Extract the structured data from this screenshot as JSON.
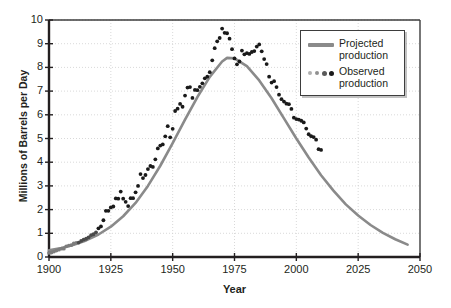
{
  "chart_data": {
    "type": "line",
    "title": "",
    "xlabel": "Year",
    "ylabel": "Millions of Barrels per Day",
    "xlim": [
      1900,
      2050
    ],
    "ylim": [
      0,
      10
    ],
    "xticks": [
      1900,
      1925,
      1950,
      1975,
      2000,
      2025,
      2050
    ],
    "yticks": [
      0,
      1,
      2,
      3,
      4,
      5,
      6,
      7,
      8,
      9,
      10
    ],
    "grid": true,
    "legend_position": "top-right",
    "colors": {
      "projected": "#8a8a8a",
      "observed": "#1a1a1a",
      "axis": "#231f20",
      "grid": "#cfcfcf",
      "background": "#ffffff"
    },
    "series": [
      {
        "name": "Projected production",
        "type": "line",
        "color": "#8a8a8a",
        "points": [
          [
            1900,
            0.28
          ],
          [
            1905,
            0.38
          ],
          [
            1910,
            0.52
          ],
          [
            1915,
            0.7
          ],
          [
            1920,
            0.95
          ],
          [
            1925,
            1.28
          ],
          [
            1930,
            1.72
          ],
          [
            1935,
            2.28
          ],
          [
            1940,
            3.0
          ],
          [
            1945,
            3.85
          ],
          [
            1950,
            4.8
          ],
          [
            1955,
            5.8
          ],
          [
            1960,
            6.75
          ],
          [
            1965,
            7.6
          ],
          [
            1970,
            8.25
          ],
          [
            1972,
            8.4
          ],
          [
            1975,
            8.38
          ],
          [
            1980,
            8.05
          ],
          [
            1985,
            7.45
          ],
          [
            1990,
            6.7
          ],
          [
            1995,
            5.85
          ],
          [
            2000,
            5.0
          ],
          [
            2005,
            4.2
          ],
          [
            2010,
            3.45
          ],
          [
            2015,
            2.8
          ],
          [
            2020,
            2.22
          ],
          [
            2025,
            1.75
          ],
          [
            2030,
            1.35
          ],
          [
            2035,
            1.02
          ],
          [
            2040,
            0.75
          ],
          [
            2045,
            0.52
          ]
        ]
      },
      {
        "name": "Observed production",
        "type": "scatter",
        "color": "#1a1a1a",
        "points": [
          [
            1900,
            0.17
          ],
          [
            1901,
            0.19
          ],
          [
            1902,
            0.23
          ],
          [
            1903,
            0.27
          ],
          [
            1904,
            0.31
          ],
          [
            1905,
            0.35
          ],
          [
            1906,
            0.35
          ],
          [
            1907,
            0.45
          ],
          [
            1908,
            0.48
          ],
          [
            1909,
            0.5
          ],
          [
            1910,
            0.57
          ],
          [
            1911,
            0.6
          ],
          [
            1912,
            0.61
          ],
          [
            1913,
            0.68
          ],
          [
            1914,
            0.73
          ],
          [
            1915,
            0.77
          ],
          [
            1916,
            0.83
          ],
          [
            1917,
            0.92
          ],
          [
            1918,
            0.96
          ],
          [
            1919,
            1.04
          ],
          [
            1920,
            1.21
          ],
          [
            1921,
            1.29
          ],
          [
            1922,
            1.55
          ],
          [
            1923,
            1.95
          ],
          [
            1924,
            1.95
          ],
          [
            1925,
            2.09
          ],
          [
            1926,
            2.13
          ],
          [
            1927,
            2.47
          ],
          [
            1928,
            2.46
          ],
          [
            1929,
            2.76
          ],
          [
            1930,
            2.46
          ],
          [
            1931,
            2.33
          ],
          [
            1932,
            2.15
          ],
          [
            1933,
            2.48
          ],
          [
            1934,
            2.48
          ],
          [
            1935,
            2.73
          ],
          [
            1936,
            3.0
          ],
          [
            1937,
            3.5
          ],
          [
            1938,
            3.33
          ],
          [
            1939,
            3.46
          ],
          [
            1940,
            3.71
          ],
          [
            1941,
            3.84
          ],
          [
            1942,
            3.8
          ],
          [
            1943,
            4.12
          ],
          [
            1944,
            4.58
          ],
          [
            1945,
            4.7
          ],
          [
            1946,
            4.75
          ],
          [
            1947,
            5.09
          ],
          [
            1948,
            5.52
          ],
          [
            1949,
            5.05
          ],
          [
            1950,
            5.41
          ],
          [
            1951,
            6.16
          ],
          [
            1952,
            6.26
          ],
          [
            1953,
            6.46
          ],
          [
            1954,
            6.34
          ],
          [
            1955,
            6.81
          ],
          [
            1956,
            7.15
          ],
          [
            1957,
            7.17
          ],
          [
            1958,
            6.71
          ],
          [
            1959,
            7.05
          ],
          [
            1960,
            7.04
          ],
          [
            1961,
            7.18
          ],
          [
            1962,
            7.33
          ],
          [
            1963,
            7.54
          ],
          [
            1964,
            7.61
          ],
          [
            1965,
            7.8
          ],
          [
            1966,
            8.3
          ],
          [
            1967,
            8.81
          ],
          [
            1968,
            9.1
          ],
          [
            1969,
            9.24
          ],
          [
            1970,
            9.64
          ],
          [
            1971,
            9.46
          ],
          [
            1972,
            9.44
          ],
          [
            1973,
            9.21
          ],
          [
            1974,
            8.77
          ],
          [
            1975,
            8.38
          ],
          [
            1976,
            8.13
          ],
          [
            1977,
            8.25
          ],
          [
            1978,
            8.71
          ],
          [
            1979,
            8.55
          ],
          [
            1980,
            8.6
          ],
          [
            1981,
            8.57
          ],
          [
            1982,
            8.65
          ],
          [
            1983,
            8.69
          ],
          [
            1984,
            8.88
          ],
          [
            1985,
            8.97
          ],
          [
            1986,
            8.68
          ],
          [
            1987,
            8.35
          ],
          [
            1988,
            8.14
          ],
          [
            1989,
            7.61
          ],
          [
            1990,
            7.36
          ],
          [
            1991,
            7.42
          ],
          [
            1992,
            7.17
          ],
          [
            1993,
            6.85
          ],
          [
            1994,
            6.66
          ],
          [
            1995,
            6.56
          ],
          [
            1996,
            6.47
          ],
          [
            1997,
            6.45
          ],
          [
            1998,
            6.25
          ],
          [
            1999,
            5.88
          ],
          [
            2000,
            5.82
          ],
          [
            2001,
            5.8
          ],
          [
            2002,
            5.75
          ],
          [
            2003,
            5.68
          ],
          [
            2004,
            5.42
          ],
          [
            2005,
            5.18
          ],
          [
            2006,
            5.1
          ],
          [
            2007,
            5.06
          ],
          [
            2008,
            4.95
          ],
          [
            2009,
            4.55
          ],
          [
            2010,
            4.52
          ]
        ]
      }
    ]
  },
  "axes": {
    "y_tick_labels": [
      "10",
      "9",
      "8",
      "7",
      "6",
      "5",
      "4",
      "3",
      "2",
      "1",
      "0"
    ],
    "x_tick_labels": [
      "1900",
      "1925",
      "1950",
      "1975",
      "2000",
      "2025",
      "2050"
    ],
    "y_axis_title": "Millions of Barrels per Day",
    "x_axis_title": "Year"
  },
  "legend": {
    "items": [
      {
        "label": "Projected\nproduction",
        "marker": "line",
        "color": "#8a8a8a"
      },
      {
        "label": "Observed\nproduction",
        "marker": "dots",
        "color": "#1a1a1a"
      }
    ]
  }
}
